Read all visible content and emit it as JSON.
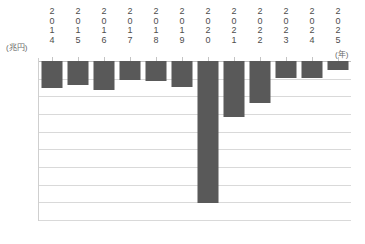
{
  "chart_data": {
    "type": "bar",
    "title": "",
    "subtitle": "",
    "xlabel": "(年)",
    "ylabel": "(兆円)",
    "categories": [
      "2014",
      "2015",
      "2016",
      "2017",
      "2018",
      "2019",
      "2020",
      "2021",
      "2022",
      "2023",
      "2024",
      "2025"
    ],
    "values": [
      -15.3,
      -13.5,
      -16.4,
      -11.0,
      -11.5,
      -14.5,
      -80.4,
      -31.5,
      -24.0,
      -9.5,
      -9.5,
      -5.0
    ],
    "series": [
      {
        "name": "",
        "values": [
          -15.3,
          -13.5,
          -16.4,
          -11.0,
          -11.5,
          -14.5,
          -80.4,
          -31.5,
          -24.0,
          -9.5,
          -9.5,
          -5.0
        ]
      }
    ],
    "ylim": [
      -90,
      0
    ],
    "yticks": [
      "-0",
      "-10",
      "-20",
      "-30",
      "-40",
      "-50",
      "-60",
      "-70",
      "-80",
      "-90"
    ],
    "ytick_values": [
      0,
      -10,
      -20,
      -30,
      -40,
      -50,
      -60,
      -70,
      -80,
      -90
    ],
    "grid": true,
    "legend": "none",
    "bar_color": "#595959",
    "gridline_color": "#d9d9d9",
    "axis_color": "#bfbfbf",
    "annotations": []
  }
}
